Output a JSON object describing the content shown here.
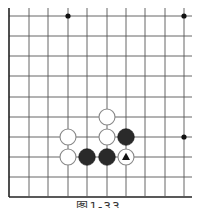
{
  "diagram": {
    "type": "go-board-fragment",
    "caption": "图1-33",
    "grid": {
      "columns": 10,
      "rows": 10,
      "x_positions": [
        9,
        29,
        48,
        68,
        87,
        107,
        126,
        145,
        165,
        184
      ],
      "y_positions": [
        16,
        36,
        56,
        76,
        97,
        117,
        137,
        157,
        177,
        197
      ],
      "line_color": "#555555",
      "edge_color": "#222222",
      "left_edge": true,
      "bottom_edge": true,
      "open_top": true,
      "open_right": true
    },
    "star_points": [
      {
        "col": 3,
        "row": 0
      },
      {
        "col": 9,
        "row": 0
      },
      {
        "col": 9,
        "row": 6
      }
    ],
    "stones": [
      {
        "color": "white",
        "col": 5,
        "row": 5
      },
      {
        "color": "white",
        "col": 3,
        "row": 6
      },
      {
        "color": "white",
        "col": 5,
        "row": 6
      },
      {
        "color": "black",
        "col": 6,
        "row": 6
      },
      {
        "color": "white",
        "col": 3,
        "row": 7
      },
      {
        "color": "black",
        "col": 4,
        "row": 7
      },
      {
        "color": "black",
        "col": 5,
        "row": 7
      },
      {
        "color": "white",
        "col": 6,
        "row": 7,
        "marker": "triangle"
      }
    ],
    "colors": {
      "black_stone": "#2a2a2a",
      "white_stone": "#ffffff",
      "white_stone_border": "#888888",
      "marker": "#111111"
    }
  }
}
